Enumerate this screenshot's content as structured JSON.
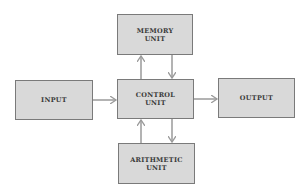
{
  "diagram": {
    "nodes": {
      "memory": {
        "line1": "MEMORY",
        "line2": "UNIT"
      },
      "input": {
        "line1": "INPUT"
      },
      "control": {
        "line1": "CONTROL",
        "line2": "UNIT"
      },
      "output": {
        "line1": "OUTPUT"
      },
      "arithmetic": {
        "line1": "ARITHMETIC",
        "line2": "UNIT"
      }
    },
    "edges": [
      {
        "from": "input",
        "to": "control"
      },
      {
        "from": "control",
        "to": "output"
      },
      {
        "from": "control",
        "to": "memory"
      },
      {
        "from": "memory",
        "to": "control"
      },
      {
        "from": "control",
        "to": "arithmetic"
      },
      {
        "from": "arithmetic",
        "to": "control"
      }
    ],
    "colors": {
      "box_fill": "#d9d9d9",
      "box_border": "#7a7a7a",
      "arrow": "#9a9a9a",
      "text": "#3a3a3a"
    }
  }
}
